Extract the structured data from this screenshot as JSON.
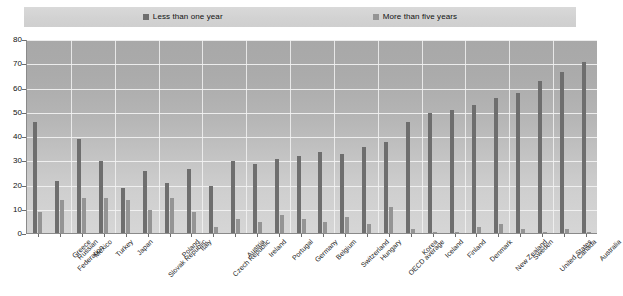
{
  "legend": {
    "items": [
      {
        "label": "Less than one year",
        "color": "#6e6e6e",
        "icon": "square-swatch-icon"
      },
      {
        "label": "More than five years",
        "color": "#949494",
        "icon": "square-swatch-icon"
      }
    ]
  },
  "axes": {
    "y_ticks": [
      "0",
      "10",
      "20",
      "30",
      "40",
      "50",
      "60",
      "70",
      "80"
    ],
    "y_min": 0,
    "y_max": 80,
    "y_step": 10,
    "x_label": "",
    "y_label": ""
  },
  "chart_data": {
    "type": "bar",
    "title": "",
    "subtitle": "",
    "xlabel": "",
    "ylabel": "",
    "ylim": [
      0,
      80
    ],
    "ytick_step": 10,
    "grid": true,
    "legend_position": "top",
    "categories": [
      "Russian Federation",
      "Greece",
      "Mexico",
      "Turkey",
      "Japan",
      "Slovak Republic",
      "Poland",
      "Italy",
      "Czech Republic",
      "Austria",
      "Ireland",
      "Portugal",
      "Germany",
      "Belgium",
      "Switzerland",
      "Hungary",
      "OECD average",
      "Korea",
      "Iceland",
      "Finland",
      "Denmark",
      "New Zealand",
      "Sweden",
      "United States",
      "Canada",
      "Australia"
    ],
    "series": [
      {
        "name": "Less than one year",
        "color": "#6e6e6e",
        "values": [
          46,
          22,
          39,
          30,
          19,
          26,
          21,
          27,
          20,
          30,
          29,
          31,
          32,
          34,
          33,
          36,
          38,
          46,
          50,
          51,
          53,
          56,
          58,
          63,
          67,
          71
        ]
      },
      {
        "name": "More than five years",
        "color": "#949494",
        "values": [
          9,
          14,
          15,
          15,
          14,
          10,
          15,
          9,
          3,
          6,
          5,
          8,
          6,
          5,
          7,
          4,
          11,
          2,
          1,
          1,
          3,
          4,
          2,
          1,
          2,
          1
        ]
      }
    ]
  }
}
